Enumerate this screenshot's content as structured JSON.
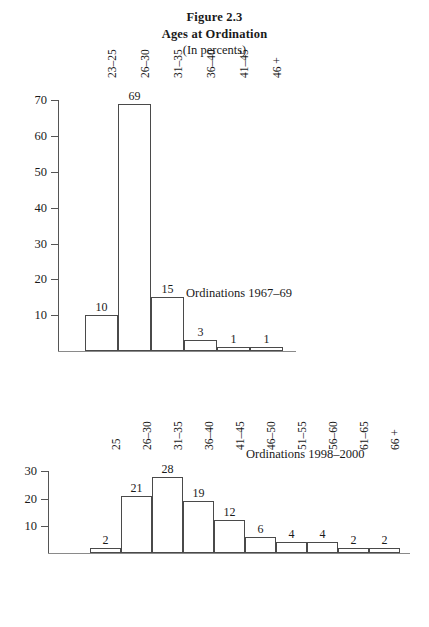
{
  "title": {
    "line1": "Figure 2.3",
    "line2": "Ages at Ordination",
    "line3": "(In percents)"
  },
  "chart_data": [
    {
      "type": "bar",
      "title": "Ordinations 1967–69",
      "annotation": "Ordinations 1967–69",
      "xlabel": "",
      "ylabel": "",
      "ylim": [
        0,
        74
      ],
      "yticks": [
        10,
        20,
        30,
        40,
        50,
        60,
        70
      ],
      "grid": false,
      "legend": false,
      "categories": [
        "23–25",
        "26–30",
        "31–35",
        "36–40",
        "41–45",
        "46 +"
      ],
      "values": [
        10,
        69,
        15,
        3,
        1,
        1
      ]
    },
    {
      "type": "bar",
      "title": "Ordinations 1998–2000",
      "annotation": "Ordinations 1998–2000",
      "xlabel": "",
      "ylabel": "",
      "ylim": [
        0,
        32
      ],
      "yticks": [
        10,
        20,
        30
      ],
      "grid": false,
      "legend": false,
      "categories": [
        "25",
        "26–30",
        "31–35",
        "36–40",
        "41–45",
        "46–50",
        "51–55",
        "56–60",
        "61–65",
        "66 +"
      ],
      "values": [
        2,
        21,
        28,
        19,
        12,
        6,
        4,
        4,
        2,
        2
      ]
    }
  ],
  "colors": {
    "background": "#ffffff",
    "bar_fill": "#ffffff",
    "bar_stroke": "#4a4a4a",
    "axis": "#555555",
    "text": "#1a1a1a"
  }
}
